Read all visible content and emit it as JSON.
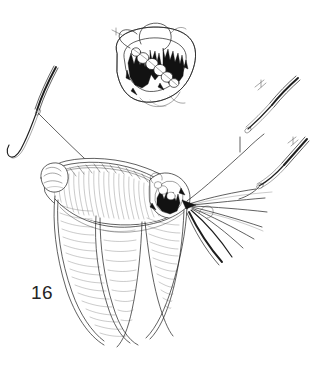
{
  "figure": {
    "number_label": "16",
    "caption": "",
    "domain": "surgical line illustration",
    "background_color": "#ffffff",
    "ink_color": "#1d1d1d",
    "width_px": 317,
    "height_px": 365
  },
  "inset": {
    "name": "cross-section-inset",
    "position": "top-center",
    "description": "Cross-sectional view of rolled sutured tissue with beaded suture knots and dark hatched shading",
    "bead_count": 6,
    "outline_color": "#1d1d1d",
    "shading_color": "#121212"
  },
  "instruments": [
    {
      "id": "needle-left",
      "label": "curved suture needle",
      "position": "upper-left",
      "curved": true,
      "has_thread": true
    },
    {
      "id": "needle-right-upper",
      "label": "curved suture needle",
      "position": "upper-right",
      "curved": true,
      "has_thread": true
    },
    {
      "id": "needle-right-lower",
      "label": "curved suture needle",
      "position": "mid-right",
      "curved": true,
      "has_thread": true
    }
  ],
  "anatomy": {
    "rolled_graft": {
      "label": "rolled tissue cylinder with running suture line",
      "position": "center"
    },
    "tissue_flaps": {
      "label": "hatched tissue flaps",
      "count": 3,
      "position": "lower-center"
    }
  },
  "sutures": {
    "fan_thread_count": 6,
    "fan_direction": "right",
    "anchor_point": "central dark knot cluster"
  }
}
